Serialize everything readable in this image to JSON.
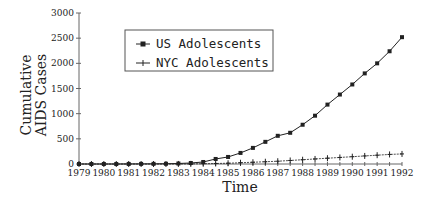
{
  "chart_data": {
    "type": "line",
    "title": "",
    "xlabel": "Time",
    "ylabel": "Cumulative AIDS Cases",
    "ylabel_lines": [
      "Cumulative",
      "AIDS Cases"
    ],
    "ylim": [
      0,
      3000
    ],
    "yticks": [
      0,
      500,
      1000,
      1500,
      2000,
      2500,
      3000
    ],
    "xticks": [
      "1979",
      "1980",
      "1981",
      "1982",
      "1983",
      "1984",
      "1985",
      "1986",
      "1987",
      "1988",
      "1989",
      "1990",
      "1991",
      "1992"
    ],
    "grid": false,
    "legend_position": "upper-left-inside",
    "x": [
      1979.0,
      1979.5,
      1980.0,
      1980.5,
      1981.0,
      1981.5,
      1982.0,
      1982.5,
      1983.0,
      1983.5,
      1984.0,
      1984.5,
      1985.0,
      1985.5,
      1986.0,
      1986.5,
      1987.0,
      1987.5,
      1988.0,
      1988.5,
      1989.0,
      1989.5,
      1990.0,
      1990.5,
      1991.0,
      1991.5,
      1992.0
    ],
    "series": [
      {
        "name": "US Adolescents",
        "marker": "square",
        "values": [
          0,
          0,
          0,
          0,
          1,
          2,
          3,
          5,
          10,
          20,
          40,
          100,
          140,
          220,
          320,
          440,
          560,
          620,
          780,
          960,
          1180,
          1380,
          1580,
          1800,
          2000,
          2240,
          2520
        ]
      },
      {
        "name": "NYC Adolescents",
        "marker": "plus",
        "values": [
          0,
          0,
          0,
          0,
          0,
          0,
          0,
          0,
          1,
          2,
          5,
          10,
          15,
          25,
          35,
          45,
          55,
          70,
          85,
          100,
          115,
          130,
          145,
          160,
          175,
          190,
          200
        ]
      }
    ]
  },
  "legend": {
    "items": [
      {
        "label": "US Adolescents",
        "marker": "square"
      },
      {
        "label": "NYC Adolescents",
        "marker": "plus"
      }
    ]
  }
}
